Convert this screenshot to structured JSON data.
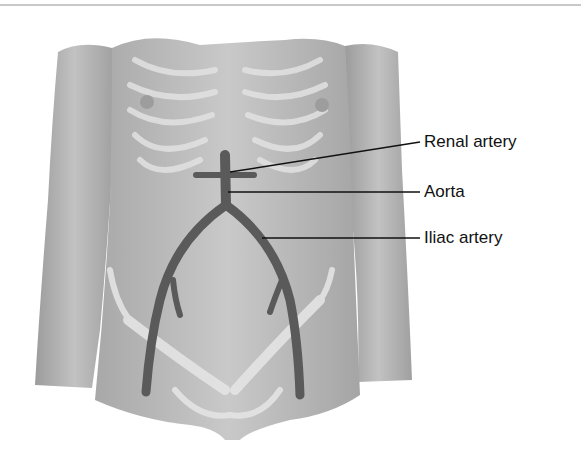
{
  "figure": {
    "labels": [
      {
        "id": "renal",
        "text": "Renal artery",
        "x": 424,
        "y": 133
      },
      {
        "id": "aorta",
        "text": "Aorta",
        "x": 424,
        "y": 183
      },
      {
        "id": "iliac",
        "text": "Iliac artery",
        "x": 424,
        "y": 229
      }
    ]
  },
  "colors": {
    "skin": "#bdbdbd",
    "skin_dark": "#8f8f8f",
    "artery": "#5a5a5a",
    "bone": "#e4e4e4",
    "leader": "#111111"
  }
}
